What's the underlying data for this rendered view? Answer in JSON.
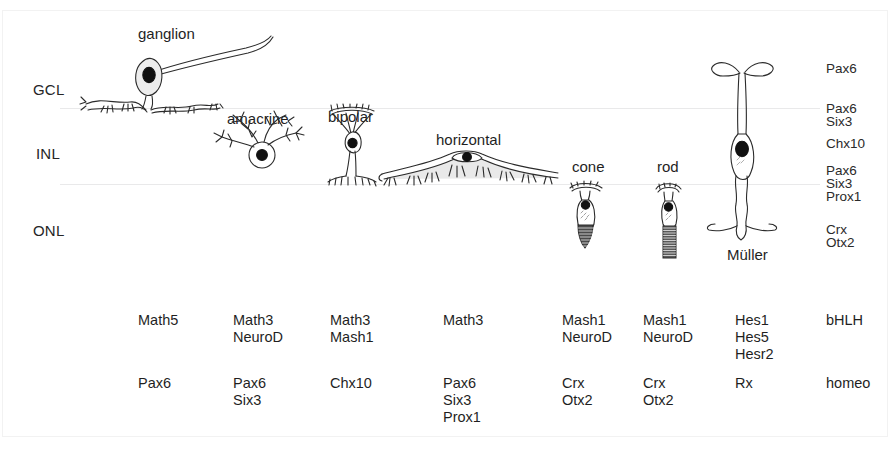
{
  "figure": {
    "background_color": "#ffffff",
    "ink_color": "#1f1f1f",
    "layer_line_color": "#e9e9ea"
  },
  "layers": [
    {
      "id": "gcl",
      "label": "GCL",
      "full_name": "ganglion cell layer"
    },
    {
      "id": "inl",
      "label": "INL",
      "full_name": "inner nuclear layer"
    },
    {
      "id": "onl",
      "label": "ONL",
      "full_name": "outer nuclear layer"
    }
  ],
  "cells": [
    {
      "id": "ganglion",
      "label": "ganglion"
    },
    {
      "id": "amacrine",
      "label": "amacrine"
    },
    {
      "id": "bipolar",
      "label": "bipolar"
    },
    {
      "id": "horizontal",
      "label": "horizontal"
    },
    {
      "id": "cone",
      "label": "cone"
    },
    {
      "id": "rod",
      "label": "rod"
    },
    {
      "id": "muller",
      "label": "Müller"
    }
  ],
  "layer_gene_annotations": [
    {
      "id": "gcl-genes",
      "genes": [
        "Pax6"
      ]
    },
    {
      "id": "gcl-inl-border-genes",
      "genes": [
        "Pax6",
        "Six3"
      ]
    },
    {
      "id": "inl-genes",
      "genes": [
        "Chx10"
      ]
    },
    {
      "id": "inl-onl-border-genes",
      "genes": [
        "Pax6",
        "Six3",
        "Prox1"
      ]
    },
    {
      "id": "onl-genes",
      "genes": [
        "Crx",
        "Otx2"
      ]
    }
  ],
  "gene_table": {
    "row_categories": [
      "bHLH",
      "homeo"
    ],
    "columns": [
      {
        "cell": "ganglion",
        "bHLH": [
          "Math5"
        ],
        "homeo": [
          "Pax6"
        ]
      },
      {
        "cell": "amacrine",
        "bHLH": [
          "Math3",
          "NeuroD"
        ],
        "homeo": [
          "Pax6",
          "Six3"
        ]
      },
      {
        "cell": "bipolar",
        "bHLH": [
          "Math3",
          "Mash1"
        ],
        "homeo": [
          "Chx10"
        ]
      },
      {
        "cell": "horizontal",
        "bHLH": [
          "Math3"
        ],
        "homeo": [
          "Pax6",
          "Six3",
          "Prox1"
        ]
      },
      {
        "cell": "cone",
        "bHLH": [
          "Mash1",
          "NeuroD"
        ],
        "homeo": [
          "Crx",
          "Otx2"
        ]
      },
      {
        "cell": "rod",
        "bHLH": [
          "Mash1",
          "NeuroD"
        ],
        "homeo": [
          "Crx",
          "Otx2"
        ]
      },
      {
        "cell": "muller",
        "bHLH": [
          "Hes1",
          "Hes5",
          "Hesr2"
        ],
        "homeo": [
          "Rx"
        ]
      }
    ],
    "category_label_bhlh": "bHLH",
    "category_label_homeo": "homeo"
  }
}
